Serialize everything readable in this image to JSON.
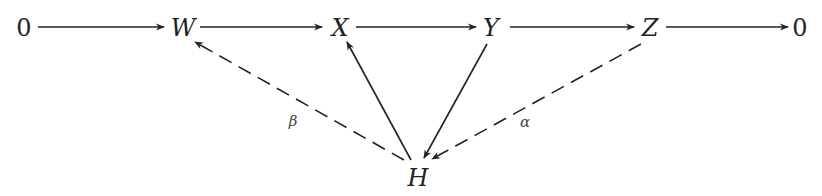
{
  "diagram": {
    "type": "commutative-diagram",
    "colors": {
      "stroke": "#222222",
      "background": "#ffffff"
    },
    "nodes": {
      "zero_left": {
        "label": "0",
        "x": 24,
        "y": 28,
        "italic": false
      },
      "W": {
        "label": "W",
        "x": 183,
        "y": 28,
        "italic": true
      },
      "X": {
        "label": "X",
        "x": 340,
        "y": 28,
        "italic": true
      },
      "Y": {
        "label": "Y",
        "x": 491,
        "y": 28,
        "italic": true
      },
      "Z": {
        "label": "Z",
        "x": 650,
        "y": 28,
        "italic": true
      },
      "zero_right": {
        "label": "0",
        "x": 800,
        "y": 28,
        "italic": false
      },
      "H": {
        "label": "H",
        "x": 418,
        "y": 178,
        "italic": true
      }
    },
    "edges": [
      {
        "from": "0",
        "to": "W",
        "style": "solid"
      },
      {
        "from": "W",
        "to": "X",
        "style": "solid"
      },
      {
        "from": "X",
        "to": "Y",
        "style": "solid"
      },
      {
        "from": "Y",
        "to": "Z",
        "style": "solid"
      },
      {
        "from": "Z",
        "to": "0",
        "style": "solid"
      },
      {
        "from": "H",
        "to": "W",
        "style": "dashed",
        "label": "β"
      },
      {
        "from": "H",
        "to": "X",
        "style": "solid"
      },
      {
        "from": "Y",
        "to": "H",
        "style": "solid"
      },
      {
        "from": "Z",
        "to": "H",
        "style": "dashed",
        "label": "α"
      }
    ],
    "labels": {
      "beta": {
        "text": "β",
        "x": 293,
        "y": 121
      },
      "alpha": {
        "text": "α",
        "x": 525,
        "y": 122
      }
    }
  }
}
